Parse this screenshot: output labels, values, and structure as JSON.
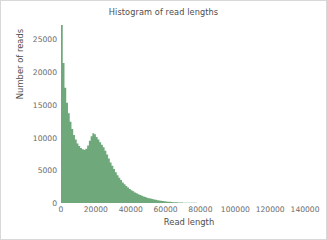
{
  "figure": {
    "title": "Histogram of read lengths",
    "background_color": "#ffffff",
    "border_color": "#d8d8d8",
    "title_color": "#4d4d4d"
  },
  "chart_data": {
    "type": "bar",
    "title": "Histogram of read lengths",
    "xlabel": "Read length",
    "ylabel": "Number of reads",
    "xlim": [
      0,
      148000
    ],
    "ylim": [
      0,
      27500
    ],
    "grid": false,
    "legend": null,
    "bar_color": "#6fa87a",
    "bin_width": 1000,
    "xticks": [
      0,
      20000,
      40000,
      60000,
      80000,
      100000,
      120000,
      140000
    ],
    "xtick_labels": [
      "0",
      "20000",
      "40000",
      "60000",
      "80000",
      "100000",
      "120000",
      "140000"
    ],
    "yticks": [
      0,
      5000,
      10000,
      15000,
      20000,
      25000
    ],
    "ytick_labels": [
      "0",
      "5000",
      "10000",
      "15000",
      "20000",
      "25000"
    ],
    "x": [
      500,
      1500,
      2500,
      3500,
      4500,
      5500,
      6500,
      7500,
      8500,
      9500,
      10500,
      11500,
      12500,
      13500,
      14500,
      15500,
      16500,
      17500,
      18500,
      19500,
      20500,
      21500,
      22500,
      23500,
      24500,
      25500,
      26500,
      27500,
      28500,
      29500,
      30500,
      31500,
      32500,
      33500,
      34500,
      35500,
      36500,
      37500,
      38500,
      39500,
      40500,
      41500,
      42500,
      43500,
      44500,
      45500,
      46500,
      47500,
      48500,
      49500,
      50500,
      51500,
      52500,
      53500,
      54500,
      55500,
      56500,
      57500,
      58500,
      59500,
      60500,
      61500,
      62500,
      63500,
      64500,
      65500,
      66500,
      67500,
      68500,
      69500,
      70500,
      75500,
      80500,
      85500,
      90500,
      95500,
      100500,
      110500,
      120500,
      130500,
      140500
    ],
    "values": [
      27200,
      21400,
      17600,
      15300,
      13700,
      12400,
      11300,
      10400,
      9700,
      9100,
      8700,
      8400,
      8200,
      8150,
      8300,
      8800,
      9500,
      10200,
      10650,
      10500,
      10100,
      9700,
      9300,
      8900,
      8500,
      8000,
      7400,
      6800,
      6200,
      5700,
      5200,
      4700,
      4250,
      3850,
      3500,
      3150,
      2850,
      2600,
      2350,
      2150,
      1950,
      1780,
      1620,
      1480,
      1340,
      1220,
      1100,
      1000,
      900,
      820,
      740,
      670,
      600,
      540,
      480,
      430,
      385,
      340,
      300,
      265,
      230,
      200,
      175,
      150,
      130,
      112,
      96,
      82,
      70,
      60,
      50,
      30,
      18,
      11,
      7,
      4,
      2,
      1,
      1,
      0,
      0
    ]
  }
}
